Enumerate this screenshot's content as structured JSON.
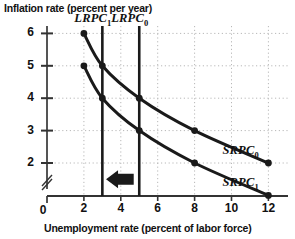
{
  "chart_data": {
    "type": "line",
    "title": "",
    "xlabel": "Unemployment rate (percent of labor force)",
    "ylabel": "Inflation rate (percent per year)",
    "xlim": [
      0,
      12.8
    ],
    "ylim": [
      0.6,
      6.4
    ],
    "xticks": [
      "0",
      "2",
      "4",
      "6",
      "8",
      "10",
      "12"
    ],
    "xtick_values": [
      0,
      2,
      4,
      6,
      8,
      10,
      12
    ],
    "yticks": [
      "2",
      "3",
      "4",
      "5",
      "6"
    ],
    "ytick_values": [
      2,
      3,
      4,
      5,
      6
    ],
    "y_axis_break": true,
    "grid": true,
    "grid_style": "dotted",
    "legend_position": "inline-right",
    "series": [
      {
        "name": "SRPC0",
        "label": "SRPC",
        "sub": "0",
        "points": [
          [
            2,
            6
          ],
          [
            3,
            5
          ],
          [
            5,
            4
          ],
          [
            8,
            3
          ],
          [
            12,
            2
          ]
        ]
      },
      {
        "name": "SRPC1",
        "label": "SRPC",
        "sub": "1",
        "points": [
          [
            2,
            5
          ],
          [
            3,
            4
          ],
          [
            5,
            3
          ],
          [
            8,
            2
          ],
          [
            12,
            1
          ]
        ]
      }
    ],
    "vertical_lines": [
      {
        "name": "LRPC1",
        "label": "LRPC",
        "sub": "1",
        "x": 3
      },
      {
        "name": "LRPC0",
        "label": "LRPC",
        "sub": "0",
        "x": 5
      }
    ],
    "annotations": [
      {
        "name": "shift-arrow",
        "direction": "left",
        "x_from": 4.7,
        "x_to": 3.2,
        "y": 1.5
      }
    ],
    "colors": {
      "axis": "#555555",
      "curve": "#1a1a1a",
      "grid": "#b8b8b8",
      "text": "#111111"
    }
  }
}
